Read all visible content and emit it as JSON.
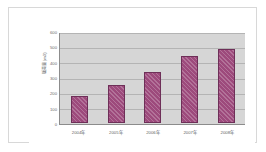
{
  "chart_data": {
    "type": "bar",
    "title": "",
    "xlabel": "",
    "ylabel": "販売量(m3)",
    "categories": [
      "2004年",
      "2005年",
      "2006年",
      "2007年",
      "2008年"
    ],
    "values": [
      180,
      255,
      340,
      450,
      495
    ],
    "ylim": [
      0,
      600
    ],
    "ytick_labels": [
      "0",
      "100",
      "200",
      "300",
      "400",
      "500",
      "600"
    ],
    "ytick_values": [
      0,
      100,
      200,
      300,
      400,
      500,
      600
    ],
    "grid": true,
    "legend": "none",
    "series": [
      {
        "name": "販売量",
        "values": [
          180,
          255,
          340,
          450,
          495
        ]
      }
    ]
  },
  "style": {
    "bar_color": "#9d4a7c",
    "bar_border_color": "#6e2f58",
    "plot_background": "#d6d6d6",
    "gridline_color": "#b4b4b4",
    "axis_color": "#8c8c8c",
    "page_background": "#ffffff",
    "frame_border_color": "#d8d8d8",
    "tick_text_color": "#6a6a6a"
  }
}
